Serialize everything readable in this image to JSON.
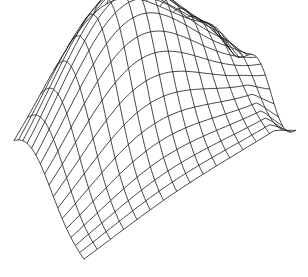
{
  "figure": {
    "type": "3d-wireframe-surface",
    "colors": {
      "background": "#ffffff",
      "line": "#1a1a1a"
    },
    "grid": {
      "rows": 16,
      "cols": 16
    },
    "projection": {
      "origin": [
        84,
        262
      ],
      "u_axis": [
        -70,
        -77
      ],
      "v_axis": [
        212,
        -144
      ],
      "height_scale": 150
    },
    "surface": {
      "peak_u": 0.78,
      "peak_v": 0.42,
      "sigma_u": 0.32,
      "sigma_v": 0.3,
      "edge_droop": 0.18
    }
  }
}
